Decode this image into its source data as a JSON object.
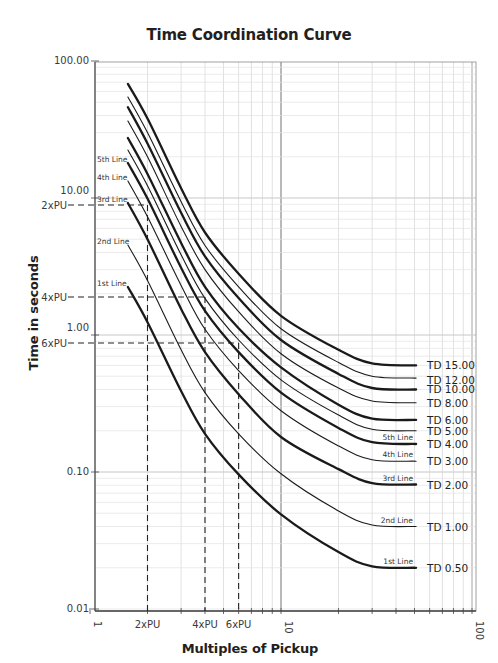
{
  "chart_data": {
    "type": "line",
    "title": "Time Coordination Curve",
    "xlabel": "Multiples of Pickup",
    "ylabel": "Time in seconds",
    "xscale": "log",
    "yscale": "log",
    "xlim": [
      1,
      100
    ],
    "ylim": [
      0.01,
      100
    ],
    "grid": true,
    "legend": "none (series labeled at right end)",
    "x_tick_labels": [
      "1",
      "2xPU",
      "4xPU",
      "6xPU",
      "10",
      "100"
    ],
    "y_tick_labels": [
      "100.00",
      "10.00",
      "1.00",
      "0.10",
      "0.01"
    ],
    "series": [
      {
        "name": "TD 15.00",
        "weight": "bold",
        "points": [
          [
            1.58,
            68
          ],
          [
            2,
            38
          ],
          [
            3,
            11.8
          ],
          [
            4,
            5.6
          ],
          [
            6,
            2.8
          ],
          [
            10,
            1.38
          ],
          [
            20,
            0.78
          ],
          [
            30,
            0.62
          ],
          [
            51,
            0.6
          ]
        ]
      },
      {
        "name": "TD 12.00",
        "weight": "thin",
        "points": [
          [
            1.58,
            54.6
          ],
          [
            2,
            30
          ],
          [
            3,
            9.4
          ],
          [
            4,
            4.5
          ],
          [
            6,
            2.25
          ],
          [
            10,
            1.11
          ],
          [
            20,
            0.63
          ],
          [
            30,
            0.5
          ],
          [
            51,
            0.485
          ]
        ]
      },
      {
        "name": "TD 10.00",
        "weight": "bold",
        "points": [
          [
            1.58,
            46
          ],
          [
            2,
            25
          ],
          [
            3,
            7.8
          ],
          [
            4,
            3.75
          ],
          [
            6,
            1.86
          ],
          [
            10,
            0.92
          ],
          [
            20,
            0.52
          ],
          [
            30,
            0.41
          ],
          [
            51,
            0.4
          ]
        ]
      },
      {
        "name": "TD 8.00",
        "weight": "thin",
        "points": [
          [
            1.58,
            36.5
          ],
          [
            2,
            20
          ],
          [
            3,
            6.2
          ],
          [
            4,
            3.0
          ],
          [
            6,
            1.48
          ],
          [
            10,
            0.73
          ],
          [
            20,
            0.41
          ],
          [
            30,
            0.33
          ],
          [
            51,
            0.32
          ]
        ]
      },
      {
        "name": "TD 6.00",
        "weight": "bold",
        "points": [
          [
            1.58,
            27.4
          ],
          [
            2,
            15
          ],
          [
            3,
            4.7
          ],
          [
            4,
            2.25
          ],
          [
            6,
            1.12
          ],
          [
            10,
            0.58
          ],
          [
            20,
            0.31
          ],
          [
            30,
            0.245
          ],
          [
            51,
            0.24
          ]
        ]
      },
      {
        "name": "TD 5.00",
        "weight": "thin",
        "points": [
          [
            1.58,
            22.4
          ],
          [
            2,
            12.3
          ],
          [
            3,
            3.85
          ],
          [
            4,
            1.85
          ],
          [
            6,
            0.92
          ],
          [
            10,
            0.47
          ],
          [
            20,
            0.26
          ],
          [
            30,
            0.205
          ],
          [
            51,
            0.2
          ]
        ]
      },
      {
        "name": "TD 4.00",
        "weight": "bold",
        "label": "5th Line",
        "points": [
          [
            1.58,
            18
          ],
          [
            2,
            9.9
          ],
          [
            3,
            3.1
          ],
          [
            4,
            1.5
          ],
          [
            6,
            0.75
          ],
          [
            10,
            0.38
          ],
          [
            20,
            0.21
          ],
          [
            30,
            0.165
          ],
          [
            51,
            0.16
          ]
        ]
      },
      {
        "name": "TD 3.00",
        "weight": "thin",
        "label": "4th Line",
        "points": [
          [
            1.58,
            13.3
          ],
          [
            2,
            7.3
          ],
          [
            3,
            2.3
          ],
          [
            4,
            1.1
          ],
          [
            6,
            0.55
          ],
          [
            10,
            0.28
          ],
          [
            20,
            0.155
          ],
          [
            30,
            0.123
          ],
          [
            51,
            0.12
          ]
        ]
      },
      {
        "name": "TD 2.00",
        "weight": "bold",
        "label": "3rd Line",
        "points": [
          [
            1.58,
            9.2
          ],
          [
            2,
            5.0
          ],
          [
            3,
            1.55
          ],
          [
            4,
            0.75
          ],
          [
            6,
            0.37
          ],
          [
            10,
            0.18
          ],
          [
            20,
            0.105
          ],
          [
            30,
            0.083
          ],
          [
            51,
            0.081
          ]
        ]
      },
      {
        "name": "TD 1.00",
        "weight": "thin",
        "label": "2nd Line",
        "points": [
          [
            1.58,
            4.54
          ],
          [
            2,
            2.5
          ],
          [
            3,
            0.78
          ],
          [
            4,
            0.38
          ],
          [
            6,
            0.19
          ],
          [
            10,
            0.097
          ],
          [
            20,
            0.052
          ],
          [
            30,
            0.041
          ],
          [
            51,
            0.04
          ]
        ]
      },
      {
        "name": "TD 0.50",
        "weight": "bold",
        "label": "1st Line",
        "points": [
          [
            1.58,
            2.24
          ],
          [
            2,
            1.24
          ],
          [
            3,
            0.39
          ],
          [
            4,
            0.19
          ],
          [
            6,
            0.096
          ],
          [
            10,
            0.049
          ],
          [
            20,
            0.026
          ],
          [
            30,
            0.0205
          ],
          [
            51,
            0.02
          ]
        ]
      }
    ],
    "annotations": [
      {
        "label": "2xPU",
        "x": 2,
        "y": 9.2,
        "style": "dashed"
      },
      {
        "label": "4xPU",
        "x": 4,
        "y": 1.9,
        "style": "dashed"
      },
      {
        "label": "6xPU",
        "x": 6,
        "y": 0.87,
        "style": "dashed"
      }
    ]
  },
  "title": "Time Coordination Curve",
  "x_axis_title": "Multiples of Pickup",
  "y_axis_title": "Time in seconds"
}
